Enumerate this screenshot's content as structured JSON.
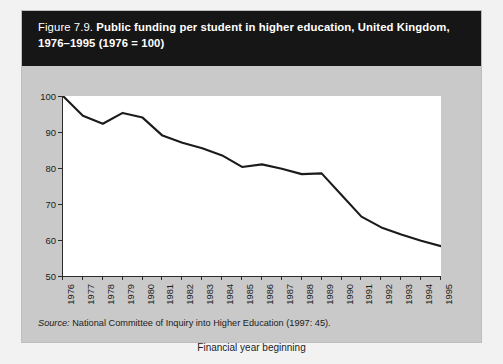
{
  "figure": {
    "number_label": "Figure 7.9.",
    "title_line1": "Public funding per student in higher education, United Kingdom,",
    "title_line2": "1976–1995 (1976 = 100)",
    "source_label": "Source:",
    "source_text": "National Committee of Inquiry into Higher Education (1997: 45).",
    "title_bar_color": "#161616",
    "panel_color": "#c9c9c9",
    "plot_background": "#ffffff",
    "line_color": "#1b1b1b"
  },
  "chart_data": {
    "type": "line",
    "title": "Public funding per student in higher education, United Kingdom, 1976–1995 (1976 = 100)",
    "xlabel": "Financial year beginning",
    "ylabel": "",
    "categories": [
      "1976",
      "1977",
      "1978",
      "1979",
      "1980",
      "1981",
      "1982",
      "1983",
      "1984",
      "1985",
      "1986",
      "1987",
      "1988",
      "1989",
      "1990",
      "1991",
      "1992",
      "1993",
      "1994",
      "1995"
    ],
    "values": [
      100,
      94.5,
      92.3,
      95.3,
      94.0,
      89.0,
      87.0,
      85.5,
      83.5,
      80.3,
      81.0,
      79.8,
      78.3,
      78.5,
      72.5,
      66.5,
      63.5,
      61.5,
      59.8,
      58.3
    ],
    "xlim": [
      1976,
      1995
    ],
    "ylim": [
      50,
      100
    ],
    "yticks": [
      50,
      60,
      70,
      80,
      90,
      100
    ],
    "ytick_labels": [
      "50",
      "60",
      "70",
      "80",
      "90",
      "100"
    ],
    "grid": false,
    "legend": false,
    "series_name": "Public funding per student index"
  }
}
